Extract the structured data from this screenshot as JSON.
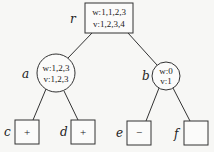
{
  "tree": {
    "root": {
      "label": "r",
      "w": "w:1,1,2,3",
      "v": "v:1,2,3,4"
    },
    "a": {
      "label": "a",
      "w": "w:1,2,3",
      "v": "v:1,2,3"
    },
    "b": {
      "label": "b",
      "w": "w:0",
      "v": "v:1"
    },
    "c": {
      "label": "c",
      "value": "+"
    },
    "d": {
      "label": "d",
      "value": "+"
    },
    "e": {
      "label": "e",
      "value": "−"
    },
    "f": {
      "label": "f",
      "value": ""
    }
  }
}
